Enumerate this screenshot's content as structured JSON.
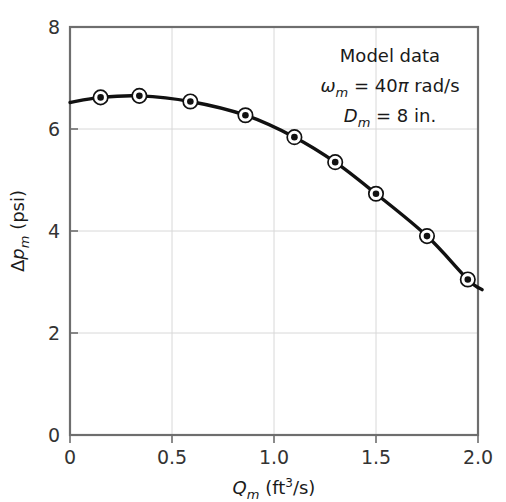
{
  "chart_data": {
    "type": "scatter",
    "title": "",
    "xlabel": "Qm (ft3/s)",
    "ylabel": "Δpm (psi)",
    "xlim": [
      0,
      2.0
    ],
    "ylim": [
      0,
      8
    ],
    "grid": true,
    "legend_position": "none",
    "x_ticks": [
      "0",
      "0.5",
      "1.0",
      "1.5",
      "2.0"
    ],
    "x_tick_values": [
      0,
      0.5,
      1.0,
      1.5,
      2.0
    ],
    "y_ticks": [
      "0",
      "2",
      "4",
      "6",
      "8"
    ],
    "y_tick_values": [
      0,
      2,
      4,
      6,
      8
    ],
    "series": [
      {
        "name": "Model data",
        "marker": "circle-with-center-dot",
        "line": "smooth fitted curve",
        "x": [
          0.15,
          0.34,
          0.59,
          0.86,
          1.1,
          1.3,
          1.5,
          1.75,
          1.95
        ],
        "y": [
          6.62,
          6.65,
          6.54,
          6.27,
          5.84,
          5.35,
          4.73,
          3.9,
          3.05
        ]
      }
    ],
    "curve_extent": {
      "x_start": 0.0,
      "y_start": 6.52,
      "x_end": 2.02,
      "y_end": 2.85
    },
    "annotations": [
      {
        "id": "line1",
        "text": "Model data"
      },
      {
        "id": "line2",
        "symbol": "ω",
        "subscript": "m",
        "equals": " = 40",
        "pi": "π",
        "units": " rad/s"
      },
      {
        "id": "line3",
        "symbol": "D",
        "subscript": "m",
        "equals": " = 8 in."
      }
    ]
  },
  "axes": {
    "y_label_delta": "Δ",
    "y_label_p": "p",
    "y_label_sub": "m",
    "y_label_unit": " (psi)",
    "x_label_q": "Q",
    "x_label_sub": "m",
    "x_label_unit_pre": " (ft",
    "x_label_unit_sup": "3",
    "x_label_unit_post": "/s)"
  },
  "colors": {
    "curve": "#111111",
    "frame": "#6e6e6e",
    "grid": "#d8d8d8",
    "text": "#1a1a1a",
    "background": "#ffffff"
  }
}
